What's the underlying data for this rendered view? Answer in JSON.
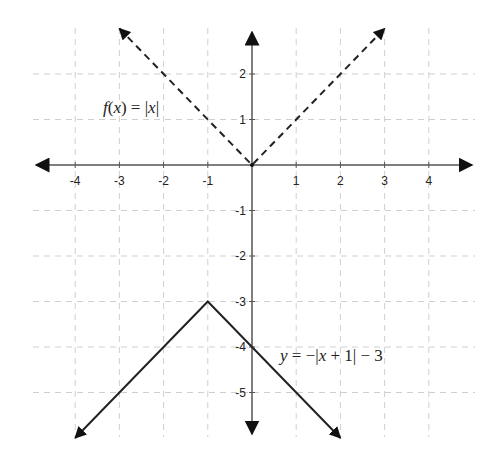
{
  "chart_data": {
    "type": "line",
    "title": "",
    "xlabel": "",
    "ylabel": "",
    "xlim": [
      -4.5,
      4.9
    ],
    "ylim": [
      -6,
      3
    ],
    "grid": true,
    "grid_style": "dashed",
    "x_ticks": [
      -4,
      -3,
      -2,
      -1,
      1,
      2,
      3,
      4
    ],
    "y_ticks": [
      2,
      1,
      -1,
      -2,
      -3,
      -4,
      -5
    ],
    "x_tick_labels": [
      "-4",
      "-3",
      "-2",
      "-1",
      "1",
      "2",
      "3",
      "4"
    ],
    "y_tick_labels": [
      "2",
      "1",
      "-1",
      "-2",
      "-3",
      "-4",
      "-5"
    ],
    "series": [
      {
        "name": "f(x) = |x|",
        "style": "dashed",
        "color": "#222222",
        "x": [
          -3,
          0,
          3
        ],
        "y": [
          3,
          0,
          3
        ],
        "arrows": true
      },
      {
        "name": "y = −|x + 1| − 3",
        "style": "solid",
        "color": "#222222",
        "x": [
          -4,
          -1,
          2
        ],
        "y": [
          -6,
          -3,
          -6
        ],
        "arrows": true
      }
    ],
    "annotations": [
      {
        "text": "f(x) = |x|",
        "x": -2.7,
        "y": 1.2
      },
      {
        "text": "y = −|x + 1| − 3",
        "x": 0.6,
        "y": -4.1
      }
    ]
  },
  "labels": {
    "f_label": {
      "f": "f",
      "open": "(",
      "x": "x",
      "close": ") = |",
      "x2": "x",
      "end": "|"
    },
    "g_label": {
      "y": "y",
      "mid": " = −|",
      "x": "x",
      "end": " + 1| − 3"
    }
  }
}
